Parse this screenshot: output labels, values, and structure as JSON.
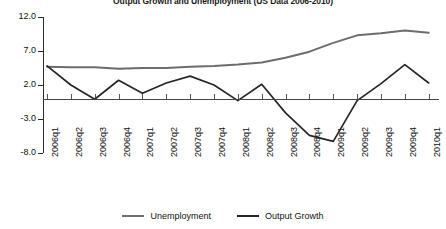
{
  "chart_data": {
    "type": "line",
    "title": "Output Growth and Unemployment (US Data 2006-2010)",
    "xlabel": "",
    "ylabel": "",
    "ylim": [
      -8.0,
      12.0
    ],
    "yticks": [
      12.0,
      7.0,
      2.0,
      -3.0,
      -8.0
    ],
    "ytick_labels": [
      "12.0",
      "7.0",
      "2.0",
      "-3.0",
      "-8.0"
    ],
    "grid": false,
    "zero_line": true,
    "legend_position": "bottom",
    "categories": [
      "2006q1",
      "2006q2",
      "2006q3",
      "2006q4",
      "2007q1",
      "2007q2",
      "2007q3",
      "2007q4",
      "2008q1",
      "2008q2",
      "2008q3",
      "2008q4",
      "2009q1",
      "2009q2",
      "2009q3",
      "2009q4",
      "2010q1"
    ],
    "series": [
      {
        "name": "Unemployment",
        "color": "#6d6d6d",
        "values": [
          4.7,
          4.6,
          4.6,
          4.4,
          4.5,
          4.5,
          4.7,
          4.8,
          5.0,
          5.3,
          6.0,
          6.9,
          8.2,
          9.3,
          9.6,
          10.0,
          9.7
        ]
      },
      {
        "name": "Output Growth",
        "color": "#262626",
        "values": [
          4.8,
          2.0,
          -0.1,
          2.7,
          0.8,
          2.3,
          3.3,
          2.0,
          -0.3,
          2.1,
          -2.1,
          -5.4,
          -6.3,
          -0.3,
          2.2,
          5.0,
          2.3
        ]
      }
    ]
  },
  "legend": {
    "items": [
      {
        "label": "Unemployment",
        "color": "#6d6d6d"
      },
      {
        "label": "Output Growth",
        "color": "#262626"
      }
    ]
  }
}
